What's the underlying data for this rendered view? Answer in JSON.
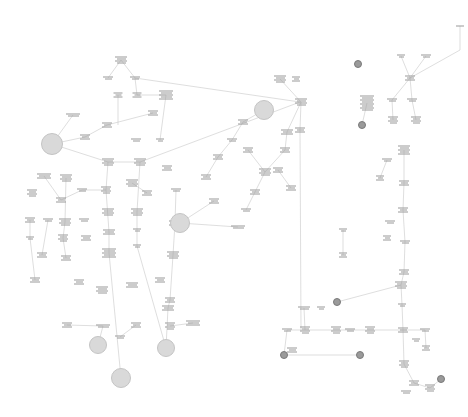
{
  "diagram": {
    "type": "flowchart",
    "legibility": "node text is not legible at this resolution",
    "colors": {
      "background": "#ffffff",
      "line": "#c8c8c8",
      "text": "#9a9a9a",
      "ending_fill": "#d9d9d9",
      "terminal_dot": "#9a9a9a"
    },
    "ending_circles": [
      {
        "x": 52,
        "y": 144,
        "r": 10
      },
      {
        "x": 264,
        "y": 110,
        "r": 9
      },
      {
        "x": 180,
        "y": 223,
        "r": 9
      },
      {
        "x": 98,
        "y": 345,
        "r": 8
      },
      {
        "x": 166,
        "y": 348,
        "r": 8
      },
      {
        "x": 121,
        "y": 378,
        "r": 9
      }
    ],
    "terminal_dots": [
      {
        "x": 358,
        "y": 64
      },
      {
        "x": 362,
        "y": 125
      },
      {
        "x": 337,
        "y": 302
      },
      {
        "x": 360,
        "y": 355
      },
      {
        "x": 441,
        "y": 379
      },
      {
        "x": 284,
        "y": 355
      }
    ],
    "nodes": [
      {
        "x": 121,
        "y": 60,
        "w": 12,
        "lines": 4
      },
      {
        "x": 108,
        "y": 78,
        "w": 10,
        "lines": 2
      },
      {
        "x": 135,
        "y": 78,
        "w": 10,
        "lines": 2
      },
      {
        "x": 118,
        "y": 95,
        "w": 9,
        "lines": 3
      },
      {
        "x": 137,
        "y": 95,
        "w": 9,
        "lines": 3
      },
      {
        "x": 166,
        "y": 95,
        "w": 14,
        "lines": 5
      },
      {
        "x": 153,
        "y": 113,
        "w": 10,
        "lines": 3
      },
      {
        "x": 73,
        "y": 115,
        "w": 14,
        "lines": 2
      },
      {
        "x": 107,
        "y": 125,
        "w": 10,
        "lines": 3
      },
      {
        "x": 85,
        "y": 137,
        "w": 10,
        "lines": 3
      },
      {
        "x": 136,
        "y": 140,
        "w": 10,
        "lines": 2
      },
      {
        "x": 160,
        "y": 140,
        "w": 8,
        "lines": 2
      },
      {
        "x": 108,
        "y": 162,
        "w": 12,
        "lines": 4
      },
      {
        "x": 140,
        "y": 162,
        "w": 12,
        "lines": 4
      },
      {
        "x": 44,
        "y": 176,
        "w": 14,
        "lines": 3
      },
      {
        "x": 66,
        "y": 178,
        "w": 12,
        "lines": 4
      },
      {
        "x": 82,
        "y": 190,
        "w": 10,
        "lines": 2
      },
      {
        "x": 106,
        "y": 190,
        "w": 10,
        "lines": 4
      },
      {
        "x": 132,
        "y": 183,
        "w": 12,
        "lines": 4
      },
      {
        "x": 147,
        "y": 193,
        "w": 10,
        "lines": 3
      },
      {
        "x": 167,
        "y": 168,
        "w": 10,
        "lines": 3
      },
      {
        "x": 176,
        "y": 190,
        "w": 10,
        "lines": 2
      },
      {
        "x": 32,
        "y": 193,
        "w": 10,
        "lines": 4
      },
      {
        "x": 61,
        "y": 200,
        "w": 10,
        "lines": 3
      },
      {
        "x": 108,
        "y": 212,
        "w": 12,
        "lines": 4
      },
      {
        "x": 137,
        "y": 212,
        "w": 12,
        "lines": 4
      },
      {
        "x": 175,
        "y": 223,
        "w": 12,
        "lines": 3
      },
      {
        "x": 30,
        "y": 220,
        "w": 10,
        "lines": 3
      },
      {
        "x": 48,
        "y": 220,
        "w": 10,
        "lines": 2
      },
      {
        "x": 65,
        "y": 222,
        "w": 12,
        "lines": 4
      },
      {
        "x": 84,
        "y": 220,
        "w": 10,
        "lines": 2
      },
      {
        "x": 109,
        "y": 232,
        "w": 12,
        "lines": 3
      },
      {
        "x": 137,
        "y": 230,
        "w": 8,
        "lines": 2
      },
      {
        "x": 137,
        "y": 246,
        "w": 8,
        "lines": 2
      },
      {
        "x": 63,
        "y": 238,
        "w": 10,
        "lines": 4
      },
      {
        "x": 86,
        "y": 238,
        "w": 10,
        "lines": 3
      },
      {
        "x": 30,
        "y": 238,
        "w": 8,
        "lines": 2
      },
      {
        "x": 42,
        "y": 255,
        "w": 10,
        "lines": 3
      },
      {
        "x": 66,
        "y": 258,
        "w": 10,
        "lines": 3
      },
      {
        "x": 109,
        "y": 253,
        "w": 14,
        "lines": 5
      },
      {
        "x": 173,
        "y": 255,
        "w": 12,
        "lines": 4
      },
      {
        "x": 35,
        "y": 280,
        "w": 10,
        "lines": 3
      },
      {
        "x": 79,
        "y": 282,
        "w": 10,
        "lines": 3
      },
      {
        "x": 102,
        "y": 290,
        "w": 12,
        "lines": 4
      },
      {
        "x": 132,
        "y": 285,
        "w": 12,
        "lines": 3
      },
      {
        "x": 160,
        "y": 280,
        "w": 10,
        "lines": 3
      },
      {
        "x": 170,
        "y": 300,
        "w": 10,
        "lines": 3
      },
      {
        "x": 214,
        "y": 201,
        "w": 10,
        "lines": 3
      },
      {
        "x": 238,
        "y": 227,
        "w": 14,
        "lines": 2
      },
      {
        "x": 206,
        "y": 177,
        "w": 10,
        "lines": 3
      },
      {
        "x": 218,
        "y": 157,
        "w": 10,
        "lines": 3
      },
      {
        "x": 232,
        "y": 140,
        "w": 10,
        "lines": 2
      },
      {
        "x": 243,
        "y": 122,
        "w": 10,
        "lines": 3
      },
      {
        "x": 248,
        "y": 150,
        "w": 10,
        "lines": 3
      },
      {
        "x": 265,
        "y": 172,
        "w": 12,
        "lines": 4
      },
      {
        "x": 255,
        "y": 192,
        "w": 10,
        "lines": 3
      },
      {
        "x": 246,
        "y": 210,
        "w": 10,
        "lines": 2
      },
      {
        "x": 285,
        "y": 150,
        "w": 10,
        "lines": 3
      },
      {
        "x": 278,
        "y": 170,
        "w": 10,
        "lines": 3
      },
      {
        "x": 291,
        "y": 188,
        "w": 10,
        "lines": 3
      },
      {
        "x": 280,
        "y": 79,
        "w": 12,
        "lines": 4
      },
      {
        "x": 296,
        "y": 79,
        "w": 8,
        "lines": 3
      },
      {
        "x": 301,
        "y": 102,
        "w": 12,
        "lines": 4
      },
      {
        "x": 287,
        "y": 132,
        "w": 12,
        "lines": 3
      },
      {
        "x": 300,
        "y": 130,
        "w": 10,
        "lines": 3
      },
      {
        "x": 367,
        "y": 103,
        "w": 14,
        "lines": 8
      },
      {
        "x": 401,
        "y": 56,
        "w": 8,
        "lines": 2
      },
      {
        "x": 426,
        "y": 56,
        "w": 10,
        "lines": 2
      },
      {
        "x": 410,
        "y": 78,
        "w": 10,
        "lines": 3
      },
      {
        "x": 392,
        "y": 100,
        "w": 10,
        "lines": 2
      },
      {
        "x": 412,
        "y": 100,
        "w": 10,
        "lines": 2
      },
      {
        "x": 393,
        "y": 120,
        "w": 10,
        "lines": 4
      },
      {
        "x": 416,
        "y": 120,
        "w": 10,
        "lines": 4
      },
      {
        "x": 404,
        "y": 150,
        "w": 12,
        "lines": 5
      },
      {
        "x": 387,
        "y": 160,
        "w": 10,
        "lines": 2
      },
      {
        "x": 380,
        "y": 178,
        "w": 8,
        "lines": 3
      },
      {
        "x": 404,
        "y": 183,
        "w": 10,
        "lines": 3
      },
      {
        "x": 403,
        "y": 210,
        "w": 10,
        "lines": 3
      },
      {
        "x": 390,
        "y": 222,
        "w": 10,
        "lines": 2
      },
      {
        "x": 387,
        "y": 238,
        "w": 8,
        "lines": 3
      },
      {
        "x": 405,
        "y": 242,
        "w": 10,
        "lines": 2
      },
      {
        "x": 404,
        "y": 272,
        "w": 10,
        "lines": 3
      },
      {
        "x": 343,
        "y": 230,
        "w": 8,
        "lines": 2
      },
      {
        "x": 343,
        "y": 255,
        "w": 8,
        "lines": 3
      },
      {
        "x": 304,
        "y": 308,
        "w": 12,
        "lines": 2
      },
      {
        "x": 321,
        "y": 308,
        "w": 8,
        "lines": 2
      },
      {
        "x": 287,
        "y": 330,
        "w": 10,
        "lines": 2
      },
      {
        "x": 305,
        "y": 330,
        "w": 10,
        "lines": 4
      },
      {
        "x": 336,
        "y": 330,
        "w": 10,
        "lines": 4
      },
      {
        "x": 370,
        "y": 330,
        "w": 10,
        "lines": 4
      },
      {
        "x": 350,
        "y": 330,
        "w": 10,
        "lines": 2
      },
      {
        "x": 403,
        "y": 330,
        "w": 10,
        "lines": 3
      },
      {
        "x": 425,
        "y": 330,
        "w": 10,
        "lines": 2
      },
      {
        "x": 401,
        "y": 285,
        "w": 12,
        "lines": 4
      },
      {
        "x": 402,
        "y": 305,
        "w": 8,
        "lines": 2
      },
      {
        "x": 416,
        "y": 340,
        "w": 8,
        "lines": 2
      },
      {
        "x": 426,
        "y": 348,
        "w": 8,
        "lines": 3
      },
      {
        "x": 404,
        "y": 364,
        "w": 10,
        "lines": 4
      },
      {
        "x": 414,
        "y": 383,
        "w": 10,
        "lines": 3
      },
      {
        "x": 430,
        "y": 388,
        "w": 10,
        "lines": 4
      },
      {
        "x": 406,
        "y": 392,
        "w": 10,
        "lines": 2
      },
      {
        "x": 292,
        "y": 350,
        "w": 10,
        "lines": 3
      },
      {
        "x": 460,
        "y": 26,
        "w": 8,
        "lines": 1
      },
      {
        "x": 168,
        "y": 308,
        "w": 12,
        "lines": 3
      },
      {
        "x": 193,
        "y": 323,
        "w": 14,
        "lines": 3
      },
      {
        "x": 170,
        "y": 326,
        "w": 10,
        "lines": 4
      },
      {
        "x": 136,
        "y": 325,
        "w": 10,
        "lines": 3
      },
      {
        "x": 103,
        "y": 326,
        "w": 14,
        "lines": 2
      },
      {
        "x": 67,
        "y": 325,
        "w": 10,
        "lines": 3
      },
      {
        "x": 120,
        "y": 337,
        "w": 10,
        "lines": 2
      }
    ],
    "edges": [
      [
        121,
        60,
        108,
        78
      ],
      [
        121,
        60,
        135,
        78
      ],
      [
        135,
        78,
        137,
        95
      ],
      [
        118,
        95,
        118,
        125
      ],
      [
        137,
        95,
        166,
        95
      ],
      [
        166,
        95,
        160,
        140
      ],
      [
        73,
        115,
        52,
        144
      ],
      [
        52,
        144,
        85,
        137
      ],
      [
        85,
        137,
        107,
        125
      ],
      [
        107,
        125,
        153,
        113
      ],
      [
        52,
        144,
        108,
        162
      ],
      [
        108,
        162,
        140,
        162
      ],
      [
        140,
        162,
        300,
        102
      ],
      [
        108,
        162,
        106,
        190
      ],
      [
        106,
        190,
        82,
        190
      ],
      [
        82,
        190,
        61,
        200
      ],
      [
        61,
        200,
        44,
        176
      ],
      [
        106,
        190,
        109,
        232
      ],
      [
        109,
        232,
        109,
        253
      ],
      [
        109,
        253,
        121,
        378
      ],
      [
        132,
        183,
        147,
        193
      ],
      [
        140,
        162,
        137,
        212
      ],
      [
        137,
        212,
        137,
        246
      ],
      [
        137,
        246,
        166,
        348
      ],
      [
        66,
        178,
        65,
        222
      ],
      [
        65,
        222,
        63,
        238
      ],
      [
        63,
        238,
        66,
        258
      ],
      [
        30,
        220,
        30,
        238
      ],
      [
        30,
        238,
        35,
        280
      ],
      [
        48,
        220,
        42,
        255
      ],
      [
        176,
        190,
        175,
        223
      ],
      [
        175,
        223,
        173,
        255
      ],
      [
        173,
        255,
        170,
        300
      ],
      [
        170,
        300,
        168,
        308
      ],
      [
        168,
        308,
        166,
        348
      ],
      [
        214,
        201,
        180,
        223
      ],
      [
        180,
        223,
        238,
        227
      ],
      [
        206,
        177,
        218,
        157
      ],
      [
        218,
        157,
        232,
        140
      ],
      [
        232,
        140,
        243,
        122
      ],
      [
        243,
        122,
        264,
        110
      ],
      [
        248,
        150,
        265,
        172
      ],
      [
        265,
        172,
        255,
        192
      ],
      [
        255,
        192,
        246,
        210
      ],
      [
        265,
        172,
        285,
        150
      ],
      [
        285,
        150,
        287,
        132
      ],
      [
        291,
        188,
        278,
        170
      ],
      [
        280,
        79,
        301,
        102
      ],
      [
        301,
        102,
        287,
        132
      ],
      [
        301,
        102,
        300,
        130
      ],
      [
        300,
        130,
        301,
        330
      ],
      [
        367,
        103,
        362,
        125
      ],
      [
        401,
        56,
        410,
        78
      ],
      [
        426,
        56,
        410,
        78
      ],
      [
        410,
        78,
        392,
        100
      ],
      [
        410,
        78,
        412,
        100
      ],
      [
        392,
        100,
        393,
        120
      ],
      [
        412,
        100,
        416,
        120
      ],
      [
        404,
        150,
        404,
        183
      ],
      [
        404,
        183,
        403,
        210
      ],
      [
        403,
        210,
        405,
        242
      ],
      [
        405,
        242,
        404,
        272
      ],
      [
        404,
        272,
        401,
        285
      ],
      [
        401,
        285,
        402,
        305
      ],
      [
        402,
        305,
        403,
        330
      ],
      [
        403,
        330,
        404,
        364
      ],
      [
        404,
        364,
        414,
        383
      ],
      [
        414,
        383,
        430,
        388
      ],
      [
        430,
        388,
        441,
        379
      ],
      [
        403,
        330,
        425,
        330
      ],
      [
        425,
        330,
        426,
        348
      ],
      [
        380,
        178,
        387,
        160
      ],
      [
        337,
        302,
        401,
        285
      ],
      [
        287,
        330,
        305,
        330
      ],
      [
        305,
        330,
        336,
        330
      ],
      [
        336,
        330,
        350,
        330
      ],
      [
        350,
        330,
        370,
        330
      ],
      [
        370,
        330,
        403,
        330
      ],
      [
        287,
        330,
        284,
        355
      ],
      [
        284,
        355,
        360,
        355
      ],
      [
        305,
        330,
        304,
        308
      ],
      [
        343,
        230,
        343,
        255
      ],
      [
        460,
        26,
        460,
        50
      ],
      [
        460,
        50,
        410,
        78
      ],
      [
        135,
        78,
        300,
        102
      ],
      [
        193,
        323,
        170,
        326
      ],
      [
        136,
        325,
        120,
        337
      ],
      [
        103,
        326,
        98,
        345
      ],
      [
        67,
        325,
        103,
        326
      ]
    ]
  }
}
